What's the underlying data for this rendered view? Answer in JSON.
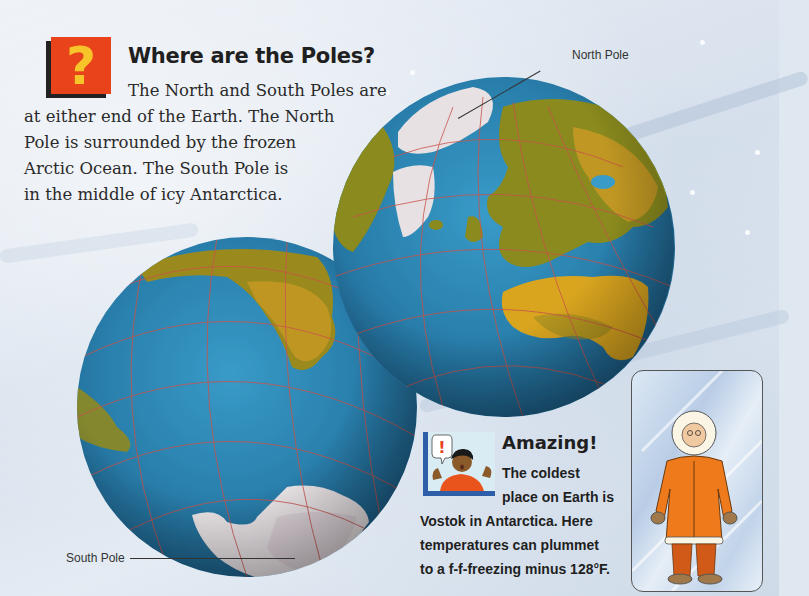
{
  "intro": {
    "icon": "question-mark-icon",
    "icon_glyph": "?",
    "title": "Where are the Poles?",
    "lines": [
      "The North and South Poles are",
      "at either end of the Earth. The North",
      "Pole is surrounded by the frozen",
      "Arctic Ocean. The South Pole is",
      "in the middle of icy Antarctica."
    ]
  },
  "globes": {
    "north_label": "North Pole",
    "south_label": "South Pole"
  },
  "amazing": {
    "icon": "surprised-boy-icon",
    "icon_glyph": "!",
    "title": "Amazing!",
    "lines": [
      "The coldest",
      "place on Earth is",
      "Vostok in Antarctica. Here",
      "temperatures can plummet",
      "to a f-f-freezing minus 128°F."
    ]
  },
  "colors": {
    "question_bg": "#e8431b",
    "question_glyph": "#f7c52a",
    "ocean": "#2a80ad",
    "land": "#8a8a1e",
    "desert": "#d9a520",
    "ice": "#e8e2e4",
    "grid": "#c8534a",
    "amazing_frame": "#2f5ea8",
    "parka": "#ee7a1c"
  }
}
